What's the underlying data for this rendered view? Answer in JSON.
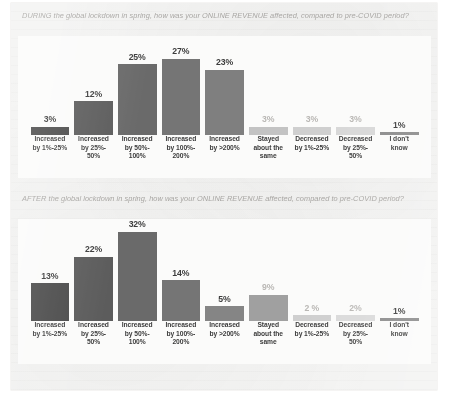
{
  "document": {
    "background_color": "#f3f3f2",
    "panel_color": "#fbfbfa"
  },
  "palette": {
    "bar_colors": [
      "#4b4b4b",
      "#5c5c5c",
      "#6a6a6a",
      "#757575",
      "#7f7f7f",
      "#9a9a9a",
      "#c6c6c6",
      "#d2d2d2",
      "#8c8c8c"
    ],
    "value_label_dark": "#3d3d3d",
    "value_label_faded": "#b9b7b4",
    "title_color": "#a8a6a3",
    "axis_label_color": "#3b3b3b"
  },
  "charts": [
    {
      "id": "during-lockdown-online-revenue",
      "title": "DURING the global lockdown in spring, how was your ONLINE REVENUE affected, compared to pre-COVID period?",
      "chart_data": {
        "type": "bar",
        "title": "DURING the global lockdown in spring, how was your ONLINE REVENUE affected, compared to pre-COVID period?",
        "xlabel": "",
        "ylabel": "",
        "ylim": [
          0,
          35
        ],
        "grid": false,
        "legend": "none",
        "categories": [
          "Increased by 1%-25%",
          "Increased by 25%-50%",
          "Increased by 50%-100%",
          "Increased by 100%-200%",
          "Increased by >200%",
          "Stayed about the same",
          "Decreased by 1%-25%",
          "Decreased by 25%-50%",
          "I don't know"
        ],
        "values": [
          3,
          12,
          25,
          27,
          23,
          3,
          3,
          3,
          1
        ],
        "value_labels": [
          "3%",
          "12%",
          "25%",
          "27%",
          "23%",
          "3%",
          "3%",
          "3%",
          "1%"
        ]
      },
      "bars": [
        {
          "label_line1": "Increased",
          "label_line2": "by 1%-25%",
          "label_line3": "",
          "value_label": "3%",
          "value": 3,
          "color": "#4b4b4b",
          "faded": false
        },
        {
          "label_line1": "Increased",
          "label_line2": "by 25%-",
          "label_line3": "50%",
          "value_label": "12%",
          "value": 12,
          "color": "#5c5c5c",
          "faded": false
        },
        {
          "label_line1": "Increased",
          "label_line2": "by 50%-",
          "label_line3": "100%",
          "value_label": "25%",
          "value": 25,
          "color": "#6a6a6a",
          "faded": false
        },
        {
          "label_line1": "Increased",
          "label_line2": "by 100%-",
          "label_line3": "200%",
          "value_label": "27%",
          "value": 27,
          "color": "#757575",
          "faded": false
        },
        {
          "label_line1": "Increased",
          "label_line2": "by >200%",
          "label_line3": "",
          "value_label": "23%",
          "value": 23,
          "color": "#7f7f7f",
          "faded": false
        },
        {
          "label_line1": "Stayed",
          "label_line2": "about the",
          "label_line3": "same",
          "value_label": "3%",
          "value": 3,
          "color": "#c3c3c3",
          "faded": true
        },
        {
          "label_line1": "Decreased",
          "label_line2": "by 1%-25%",
          "label_line3": "",
          "value_label": "3%",
          "value": 3,
          "color": "#cfcfcf",
          "faded": true
        },
        {
          "label_line1": "Decreased",
          "label_line2": "by 25%-",
          "label_line3": "50%",
          "value_label": "3%",
          "value": 3,
          "color": "#d8d8d8",
          "faded": true
        },
        {
          "label_line1": "I don't",
          "label_line2": "know",
          "label_line3": "",
          "value_label": "1%",
          "value": 1,
          "color": "#8c8c8c",
          "faded": false
        }
      ]
    },
    {
      "id": "after-lockdown-online-revenue",
      "title": "AFTER the global lockdown in spring, how was your ONLINE REVENUE affected, compared to pre-COVID period?",
      "chart_data": {
        "type": "bar",
        "title": "AFTER the global lockdown in spring, how was your ONLINE REVENUE affected, compared to pre-COVID period?",
        "xlabel": "",
        "ylabel": "",
        "ylim": [
          0,
          35
        ],
        "grid": false,
        "legend": "none",
        "categories": [
          "Increased by 1%-25%",
          "Increased by 25%-50%",
          "Increased by 50%-100%",
          "Increased by 100%-200%",
          "Increased by >200%",
          "Stayed about the same",
          "Decreased by 1%-25%",
          "Decreased by 25%-50%",
          "I don't know"
        ],
        "values": [
          13,
          22,
          32,
          14,
          5,
          9,
          2,
          2,
          1
        ],
        "value_labels": [
          "13%",
          "22%",
          "32%",
          "14%",
          "5%",
          "9%",
          "2 %",
          "2%",
          "1%"
        ]
      },
      "bars": [
        {
          "label_line1": "Increased",
          "label_line2": "by 1%-25%",
          "label_line3": "",
          "value_label": "13%",
          "value": 13,
          "color": "#4b4b4b",
          "faded": false
        },
        {
          "label_line1": "Increased",
          "label_line2": "by 25%-",
          "label_line3": "50%",
          "value_label": "22%",
          "value": 22,
          "color": "#5c5c5c",
          "faded": false
        },
        {
          "label_line1": "Increased",
          "label_line2": "by 50%-",
          "label_line3": "100%",
          "value_label": "32%",
          "value": 32,
          "color": "#6a6a6a",
          "faded": false
        },
        {
          "label_line1": "Increased",
          "label_line2": "by 100%-",
          "label_line3": "200%",
          "value_label": "14%",
          "value": 14,
          "color": "#757575",
          "faded": false
        },
        {
          "label_line1": "Increased",
          "label_line2": "by >200%",
          "label_line3": "",
          "value_label": "5%",
          "value": 5,
          "color": "#858585",
          "faded": false
        },
        {
          "label_line1": "Stayed",
          "label_line2": "about the",
          "label_line3": "same",
          "value_label": "9%",
          "value": 9,
          "color": "#a0a0a0",
          "faded": true
        },
        {
          "label_line1": "Decreased",
          "label_line2": "by 1%-25%",
          "label_line3": "",
          "value_label": "2 %",
          "value": 2,
          "color": "#cfcfcf",
          "faded": true
        },
        {
          "label_line1": "Decreased",
          "label_line2": "by 25%-",
          "label_line3": "50%",
          "value_label": "2%",
          "value": 2,
          "color": "#dadada",
          "faded": true
        },
        {
          "label_line1": "I don't",
          "label_line2": "know",
          "label_line3": "",
          "value_label": "1%",
          "value": 1,
          "color": "#8c8c8c",
          "faded": false
        }
      ]
    }
  ]
}
